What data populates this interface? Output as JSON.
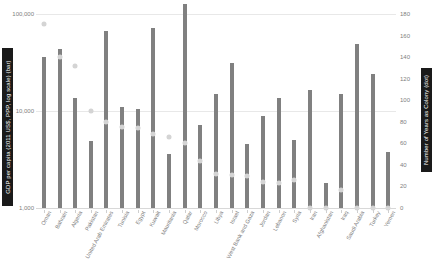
{
  "chart_data": {
    "type": "bar",
    "title": "",
    "xlabel": "",
    "ylabel": "GDP per capita (2011 US$, PPP, log scale) (bar)",
    "y2label": "Number of Years as Colony (dot)",
    "ylim": [
      1000,
      100000
    ],
    "y_scale": "log",
    "y2lim": [
      0,
      180
    ],
    "grid": true,
    "legend": "none",
    "y_ticks": [
      "1,000",
      "10,000",
      "100,000"
    ],
    "y_tick_values": [
      1000,
      10000,
      100000
    ],
    "y2_ticks": [
      "0",
      "20",
      "40",
      "60",
      "80",
      "100",
      "120",
      "140",
      "160",
      "180"
    ],
    "y2_tick_values": [
      0,
      20,
      40,
      60,
      80,
      100,
      120,
      140,
      160,
      180
    ],
    "categories": [
      "Oman",
      "Bahrain",
      "Algeria",
      "Pakistan",
      "United Arab Emirates",
      "Tunisia",
      "Egypt",
      "Kuwait",
      "Mauritania",
      "Qatar",
      "Morocco",
      "Libya",
      "Israel",
      "West Bank and Gaza",
      "Jordan",
      "Lebanon",
      "Syria",
      "Iran",
      "Afghanistan",
      "Iraq",
      "Saudi Arabia",
      "Turkey",
      "Yemen"
    ],
    "series": [
      {
        "name": "GDP per capita (2011 US$, PPP, log scale)",
        "kind": "bar",
        "axis": "left",
        "color": "#808080",
        "values": [
          36000,
          44000,
          13500,
          4900,
          67000,
          11000,
          10500,
          71000,
          3600,
          127000,
          7200,
          15000,
          31000,
          4600,
          8800,
          13500,
          5000,
          16500,
          1800,
          15000,
          49000,
          24000,
          3800
        ]
      },
      {
        "name": "Number of Years as Colony",
        "kind": "dot",
        "axis": "right",
        "color": "#d4d4d4",
        "values": [
          171,
          140,
          132,
          90,
          80,
          75,
          74,
          69,
          66,
          60,
          44,
          32,
          31,
          30,
          24,
          23,
          26,
          0,
          0,
          17,
          0,
          0,
          0
        ]
      }
    ]
  }
}
